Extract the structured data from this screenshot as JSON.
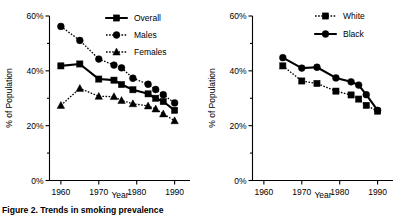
{
  "figure": {
    "caption": "Figure 2.  Trends in smoking prevalence"
  },
  "chart_data": [
    {
      "type": "line",
      "panel": "left",
      "title": "",
      "xlabel": "Year",
      "ylabel": "% of Population",
      "xlim": [
        1957,
        1993
      ],
      "ylim": [
        0,
        60
      ],
      "xticks": [
        1960,
        1970,
        1980,
        1990
      ],
      "xticklabels": [
        "1960",
        "1970",
        "1980",
        "1990"
      ],
      "yticks": [
        0,
        20,
        40,
        60
      ],
      "yticklabels": [
        "0%",
        "20%",
        "40%",
        "60%"
      ],
      "yminorticks": [
        10,
        30,
        50
      ],
      "grid": false,
      "legend_position": "top-right",
      "x": [
        1960,
        1965,
        1970,
        1974,
        1976,
        1979,
        1983,
        1985,
        1987,
        1990
      ],
      "series": [
        {
          "name": "Overall",
          "marker": "square",
          "linestyle": "solid",
          "values": [
            41.8,
            42.5,
            37.0,
            36.6,
            35.0,
            33.1,
            31.6,
            30.0,
            28.8,
            25.6
          ]
        },
        {
          "name": "Males",
          "marker": "circle",
          "linestyle": "dotted",
          "values": [
            56.2,
            51.1,
            44.3,
            42.1,
            41.1,
            37.3,
            35.1,
            33.2,
            31.3,
            28.3
          ]
        },
        {
          "name": "Females",
          "marker": "triangle",
          "linestyle": "dotted",
          "values": [
            27.4,
            33.6,
            30.7,
            30.6,
            29.2,
            28.0,
            27.2,
            26.1,
            24.3,
            21.8
          ]
        }
      ]
    },
    {
      "type": "line",
      "panel": "right",
      "title": "",
      "xlabel": "Year",
      "ylabel": "% of Population",
      "xlim": [
        1957,
        1993
      ],
      "ylim": [
        0,
        60
      ],
      "xticks": [
        1960,
        1970,
        1980,
        1990
      ],
      "xticklabels": [
        "1960",
        "1970",
        "1980",
        "1990"
      ],
      "yticks": [
        0,
        20,
        40,
        60
      ],
      "yticklabels": [
        "0%",
        "20%",
        "40%",
        "60%"
      ],
      "yminorticks": [
        10,
        30,
        50
      ],
      "grid": false,
      "legend_position": "top-right",
      "x": [
        1965,
        1970,
        1974,
        1979,
        1983,
        1985,
        1987,
        1990
      ],
      "series": [
        {
          "name": "White",
          "marker": "square",
          "linestyle": "dotted",
          "values": [
            41.8,
            36.3,
            35.4,
            32.6,
            31.2,
            29.7,
            27.4,
            25.3
          ]
        },
        {
          "name": "Black",
          "marker": "circle",
          "linestyle": "solid",
          "values": [
            44.8,
            41.0,
            41.3,
            37.4,
            36.0,
            34.8,
            31.3,
            25.6
          ]
        }
      ]
    }
  ]
}
